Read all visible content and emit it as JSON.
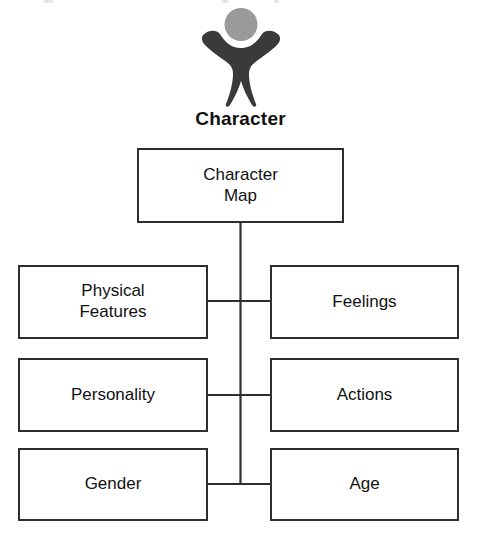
{
  "diagram": {
    "title": "Character",
    "icon_name": "person-figure-icon",
    "colors": {
      "figure_body": "#3a3a3a",
      "figure_head": "#9a9a9a",
      "box_border": "#2e2e2e",
      "line": "#2e2e2e",
      "text": "#111111",
      "background": "#ffffff"
    },
    "root": {
      "label": "Character\nMap"
    },
    "branches": [
      {
        "side": "left",
        "row": 1,
        "label": "Physical\nFeatures"
      },
      {
        "side": "right",
        "row": 1,
        "label": "Feelings"
      },
      {
        "side": "left",
        "row": 2,
        "label": "Personality"
      },
      {
        "side": "right",
        "row": 2,
        "label": "Actions"
      },
      {
        "side": "left",
        "row": 3,
        "label": "Gender"
      },
      {
        "side": "right",
        "row": 3,
        "label": "Age"
      }
    ]
  }
}
